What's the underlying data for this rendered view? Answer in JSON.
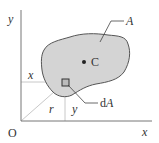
{
  "diagram": {
    "labels": {
      "y_axis": "y",
      "x_axis": "x",
      "origin": "O",
      "area": "A",
      "centroid": "C",
      "element": "dA",
      "element_d": "d",
      "element_A": "A",
      "x_dist": "x",
      "y_dist": "y",
      "radius": "r"
    },
    "colors": {
      "shape_fill": "#d4d4d4",
      "shape_stroke": "#555555",
      "axis": "#777777",
      "guide_lines": "#c8c8c8",
      "text": "#333333"
    }
  }
}
